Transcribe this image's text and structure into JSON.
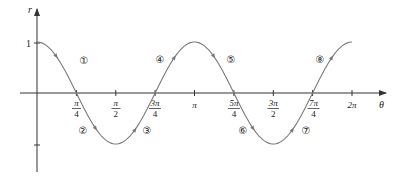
{
  "chart_data": {
    "type": "line",
    "title": "",
    "function": "r = cos(2θ)",
    "xlabel": "θ",
    "ylabel": "r",
    "xlim": [
      0,
      6.2832
    ],
    "ylim": [
      -1,
      1
    ],
    "grid": false,
    "legend": null,
    "x_ticks": [
      {
        "value": 0.7854,
        "label_num": "π",
        "label_den": "4"
      },
      {
        "value": 1.5708,
        "label_num": "π",
        "label_den": "2"
      },
      {
        "value": 2.3562,
        "label_num": "3π",
        "label_den": "4"
      },
      {
        "value": 3.1416,
        "label": "π"
      },
      {
        "value": 3.927,
        "label_num": "5π",
        "label_den": "4"
      },
      {
        "value": 4.7124,
        "label_num": "3π",
        "label_den": "2"
      },
      {
        "value": 5.4978,
        "label_num": "7π",
        "label_den": "4"
      },
      {
        "value": 6.2832,
        "label": "2π"
      }
    ],
    "y_ticks": [
      {
        "value": 1,
        "label": "1"
      },
      {
        "value": -1,
        "label": ""
      }
    ],
    "x": [
      0,
      0.3927,
      0.7854,
      1.1781,
      1.5708,
      1.9635,
      2.3562,
      2.7489,
      3.1416,
      3.5343,
      3.927,
      4.3197,
      4.7124,
      5.1051,
      5.4978,
      5.8905,
      6.2832
    ],
    "values": [
      1,
      0.7071,
      0,
      -0.7071,
      -1,
      -0.7071,
      0,
      0.7071,
      1,
      0.7071,
      0,
      -0.7071,
      -1,
      -0.7071,
      0,
      0.7071,
      1
    ],
    "annotations": [
      {
        "label": "①",
        "segment": 1,
        "theta_range": "0 to π/4"
      },
      {
        "label": "②",
        "segment": 2,
        "theta_range": "π/4 to π/2"
      },
      {
        "label": "③",
        "segment": 3,
        "theta_range": "π/2 to 3π/4"
      },
      {
        "label": "④",
        "segment": 4,
        "theta_range": "3π/4 to π"
      },
      {
        "label": "⑤",
        "segment": 5,
        "theta_range": "π to 5π/4"
      },
      {
        "label": "⑥",
        "segment": 6,
        "theta_range": "5π/4 to 3π/2"
      },
      {
        "label": "⑦",
        "segment": 7,
        "theta_range": "3π/2 to 7π/4"
      },
      {
        "label": "⑧",
        "segment": 8,
        "theta_range": "7π/4 to 2π"
      }
    ],
    "direction_arrows": "one arrowhead per segment indicating increasing θ"
  },
  "labels": {
    "x_axis": "θ",
    "y_axis": "r",
    "y_one": "1",
    "pi": "π",
    "two_pi": "2π",
    "pi_over_4_num": "π",
    "pi_over_4_den": "4",
    "pi_over_2_num": "π",
    "pi_over_2_den": "2",
    "three_pi_over_4_num": "3π",
    "three_pi_over_4_den": "4",
    "five_pi_over_4_num": "5π",
    "five_pi_over_4_den": "4",
    "three_pi_over_2_num": "3π",
    "three_pi_over_2_den": "2",
    "seven_pi_over_4_num": "7π",
    "seven_pi_over_4_den": "4",
    "seg1": "①",
    "seg2": "②",
    "seg3": "③",
    "seg4": "④",
    "seg5": "⑤",
    "seg6": "⑥",
    "seg7": "⑦",
    "seg8": "⑧"
  },
  "colors": {
    "axis": "#333333",
    "curve": "#7a7a7a",
    "text": "#222222"
  }
}
